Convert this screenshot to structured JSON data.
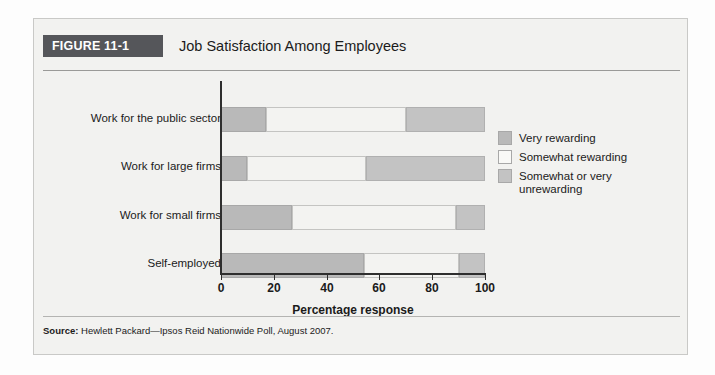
{
  "figure": {
    "banner_label": "FIGURE 11-1",
    "title": "Job Satisfaction Among Employees",
    "source_prefix": "Source:",
    "source_text": " Hewlett Packard—Ipsos Reid Nationwide Poll, August 2007."
  },
  "colors": {
    "banner_bg": "#55565a",
    "very_rewarding": "#b9b9b9",
    "somewhat_rewarding": "#f3f3f1",
    "somewhat_or_very_unrewarding": "#c3c3c3",
    "axis": "#2e2e2e",
    "panel_bg": "#f2f2f0"
  },
  "legend": {
    "items": [
      {
        "label": "Very rewarding",
        "swatch": "#b9b9b9",
        "border": "#a8a8a8"
      },
      {
        "label": "Somewhat rewarding",
        "swatch": "#f3f3f1",
        "border": "#a8a8a8"
      },
      {
        "label": "Somewhat or very unrewarding",
        "swatch": "#c3c3c3",
        "border": "#a8a8a8"
      }
    ]
  },
  "chart_data": {
    "type": "bar",
    "orientation": "horizontal",
    "stacked": true,
    "stacked_percent": true,
    "title": "Job Satisfaction Among Employees",
    "xlabel": "Percentage response",
    "ylabel": "",
    "xlim": [
      0,
      100
    ],
    "xticks": [
      0,
      20,
      40,
      60,
      80,
      100
    ],
    "xtick_labels": [
      "0",
      "20",
      "40",
      "60",
      "80",
      "100"
    ],
    "grid": false,
    "legend_position": "right",
    "categories": [
      "Work for the public sector",
      "Work for large firms",
      "Work for small firms",
      "Self-employed"
    ],
    "series": [
      {
        "name": "Very rewarding",
        "values": [
          17,
          10,
          27,
          54
        ]
      },
      {
        "name": "Somewhat rewarding",
        "values": [
          53,
          45,
          62,
          36
        ]
      },
      {
        "name": "Somewhat or very unrewarding",
        "values": [
          30,
          45,
          11,
          10
        ]
      }
    ]
  }
}
